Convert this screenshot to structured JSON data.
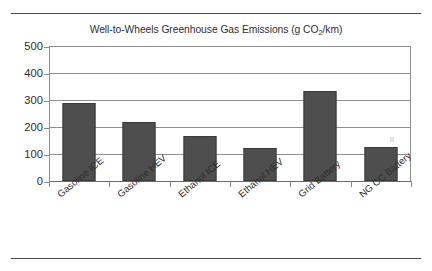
{
  "chart_data": {
    "type": "bar",
    "title": "Well-to-Wheels Greenhouse Gas Emissions (g CO2/km)",
    "title_prefix": "Well-to-Wheels Greenhouse Gas Emissions (g CO",
    "title_subscript": "2",
    "title_suffix": "/km)",
    "categories": [
      "Gasoline ICE",
      "Gasoline HEV",
      "Ethanol ICE",
      "Ethanol HEV",
      "Grid Battery",
      "NG CC Battery"
    ],
    "values": [
      290,
      218,
      165,
      122,
      335,
      127
    ],
    "xlabel": "",
    "ylabel": "",
    "ylim": [
      0,
      500
    ],
    "ytick_labels": [
      "500",
      "400",
      "300",
      "200",
      "100",
      "0"
    ],
    "ytick_values": [
      500,
      400,
      300,
      200,
      100,
      0
    ],
    "grid": true,
    "legend": false,
    "bar_color": "#4e4e4e",
    "grid_color": "#8e8e8e",
    "text_color": "#2f2f2f"
  }
}
